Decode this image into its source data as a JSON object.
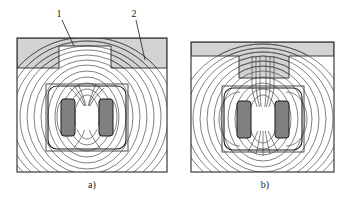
{
  "figure": {
    "type": "technical-line-drawing",
    "background_color": "#ffffff"
  },
  "callouts": [
    {
      "id": "callout-1",
      "label": "1",
      "x": 59,
      "y": 17,
      "leader": {
        "x1": 62,
        "y1": 20,
        "x2": 74,
        "y2": 46
      }
    },
    {
      "id": "callout-2",
      "label": "2",
      "x": 134,
      "y": 17,
      "leader": {
        "x1": 136,
        "y1": 20,
        "x2": 145,
        "y2": 60
      }
    }
  ],
  "panels": [
    {
      "id": "panel-a",
      "caption": "a)",
      "caption_x": 92,
      "caption_y": 188,
      "frame": {
        "x": 17,
        "y": 38,
        "w": 150,
        "h": 134
      },
      "workpiece": {
        "name": "slotted-workpiece",
        "kind": "slot",
        "fill": "#d3d3d3",
        "stroke": "#3a3a3a",
        "bar_height": 30,
        "slot_x": 59,
        "slot_w": 52,
        "slot_depth": 22
      },
      "yoke": {
        "x": 48,
        "y": 86,
        "w": 78,
        "h": 63,
        "rx": 9,
        "stroke": "#1a1a1a"
      },
      "yoke_outer": {
        "x": 46,
        "y": 84,
        "w": 82,
        "h": 67,
        "stroke": "#3a3a3a"
      },
      "coils": [
        {
          "name": "coil-left",
          "x": 61,
          "y": 99,
          "w": 14,
          "h": 37,
          "rx": 3,
          "fill": "#808080",
          "stroke": "#1a1a1a"
        },
        {
          "name": "coil-right",
          "x": 99,
          "y": 99,
          "w": 14,
          "h": 37,
          "rx": 3,
          "fill": "#808080",
          "stroke": "#1a1a1a"
        }
      ],
      "air_gap": {
        "name": "central-air-gap",
        "shape": "rounded-square",
        "cx": 87,
        "cy": 117,
        "fill": "#ffffff"
      },
      "field_lines": {
        "count": 11,
        "stroke": "#4a4a4a",
        "pattern": "concentric-dipole"
      }
    },
    {
      "id": "panel-b",
      "caption": "b)",
      "caption_x": 265,
      "caption_y": 188,
      "frame": {
        "x": 191,
        "y": 42,
        "w": 143,
        "h": 130
      },
      "workpiece": {
        "name": "toothed-workpiece",
        "kind": "tooth",
        "fill": "#d3d3d3",
        "stroke": "#3a3a3a",
        "bar_height": 14,
        "tooth_x": 239,
        "tooth_w": 50,
        "tooth_depth": 22
      },
      "yoke": {
        "x": 224,
        "y": 88,
        "w": 78,
        "h": 62,
        "rx": 9,
        "stroke": "#1a1a1a"
      },
      "yoke_outer": {
        "x": 222,
        "y": 86,
        "w": 82,
        "h": 66,
        "stroke": "#3a3a3a"
      },
      "coils": [
        {
          "name": "coil-left",
          "x": 237,
          "y": 101,
          "w": 14,
          "h": 37,
          "rx": 3,
          "fill": "#808080",
          "stroke": "#1a1a1a"
        },
        {
          "name": "coil-right",
          "x": 275,
          "y": 101,
          "w": 14,
          "h": 37,
          "rx": 3,
          "fill": "#808080",
          "stroke": "#1a1a1a"
        }
      ],
      "air_gap": {
        "name": "central-air-gap",
        "shape": "octagon",
        "cx": 263,
        "cy": 119,
        "fill": "#ffffff"
      },
      "field_lines": {
        "count": 11,
        "stroke": "#4a4a4a",
        "pattern": "vertical-through-tooth"
      }
    }
  ],
  "colors": {
    "workpiece_fill": "#d3d3d3",
    "coil_fill": "#808080",
    "line": "#3a3a3a",
    "dark_line": "#1a1a1a",
    "field_line": "#4a4a4a",
    "background": "#ffffff"
  }
}
